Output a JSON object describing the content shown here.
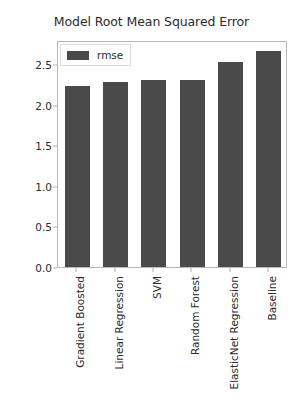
{
  "chart_data": {
    "type": "bar",
    "title": "Model Root Mean Squared Error",
    "xlabel": "",
    "ylabel": "RMSE",
    "categories": [
      "Gradient Boosted",
      "Linear Regression",
      "SVM",
      "Random Forest",
      "ElasticNet Regression",
      "Baseline"
    ],
    "values": [
      2.23,
      2.28,
      2.31,
      2.31,
      2.53,
      2.66
    ],
    "series": [
      {
        "name": "rmse",
        "values": [
          2.23,
          2.28,
          2.31,
          2.31,
          2.53,
          2.66
        ]
      }
    ],
    "ylim": [
      0.0,
      2.8
    ],
    "yticks": [
      "0.0",
      "0.5",
      "1.0",
      "1.5",
      "2.0",
      "2.5"
    ],
    "ytick_values": [
      0.0,
      0.5,
      1.0,
      1.5,
      2.0,
      2.5
    ],
    "grid": false,
    "legend": {
      "position": "upper left",
      "entries": [
        "rmse"
      ]
    },
    "colors": {
      "bar": "#4a4a4a",
      "background": "#ffffff",
      "axis": "#b8b8b8",
      "text": "#2b2b2b"
    }
  }
}
